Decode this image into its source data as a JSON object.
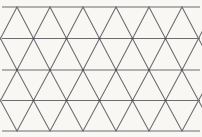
{
  "figure": {
    "name": "triangular-lattice-pattern",
    "width": 202,
    "height": 137,
    "background_color": "#f8f7f4",
    "line_color": "#6b6b70",
    "line_width": 1.05,
    "vertex_color": "#4a4a50"
  },
  "geometry": {
    "horizontal_lines": {
      "count": 5,
      "y_values": [
        7,
        38.5,
        70,
        100.5,
        131
      ],
      "row_spacing": 31,
      "x_start": 2,
      "x_end": 200
    },
    "diagonals": {
      "period": 33,
      "half_period": 16.5,
      "slope_direction": "both",
      "family_count": 2,
      "description": "Each band between consecutive horizontal lines is filled with alternating up and down diagonals meeting at the band boundaries."
    },
    "vertex_rows": [
      {
        "row": 0,
        "y": 7,
        "x_offset": 17,
        "x_values": [
          17,
          50,
          83,
          116,
          149,
          182
        ]
      },
      {
        "row": 1,
        "y": 38.5,
        "x_offset": 0.5,
        "x_values": [
          0.5,
          33.5,
          66.5,
          99.5,
          132.5,
          165.5,
          198.5
        ]
      },
      {
        "row": 2,
        "y": 70,
        "x_offset": 17,
        "x_values": [
          17,
          50,
          83,
          116,
          149,
          182
        ]
      },
      {
        "row": 3,
        "y": 100.5,
        "x_offset": 0.5,
        "x_values": [
          0.5,
          33.5,
          66.5,
          99.5,
          132.5,
          165.5,
          198.5
        ]
      },
      {
        "row": 4,
        "y": 131,
        "x_offset": 17,
        "x_values": [
          17,
          50,
          83,
          116,
          149,
          182
        ]
      }
    ],
    "bands": [
      {
        "band": 0,
        "y_top": 7,
        "y_bottom": 38.5,
        "apex_on": "top"
      },
      {
        "band": 1,
        "y_top": 38.5,
        "y_bottom": 70,
        "apex_on": "bottom"
      },
      {
        "band": 2,
        "y_top": 70,
        "y_bottom": 100.5,
        "apex_on": "top"
      },
      {
        "band": 3,
        "y_top": 100.5,
        "y_bottom": 131,
        "apex_on": "bottom"
      }
    ],
    "marked_vertices": [
      {
        "y": 38.5,
        "x_values": [
          33.5,
          66.5,
          99.5,
          132.5,
          165.5
        ]
      },
      {
        "y": 70,
        "x_values": [
          17,
          50,
          83,
          116,
          149,
          182
        ]
      },
      {
        "y": 100.5,
        "x_values": [
          33.5,
          66.5,
          99.5,
          132.5,
          165.5
        ]
      }
    ]
  }
}
